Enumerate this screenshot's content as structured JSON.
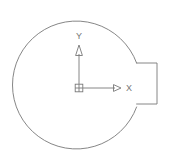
{
  "canvas": {
    "width": 171,
    "height": 165,
    "background_color": "#ffffff",
    "line_color": "#787878",
    "label_color": "#767676",
    "line_width": 0.9
  },
  "drawing": {
    "title": "",
    "type": "cad-2d-profile",
    "description": "Circular profile with rectangular keyway tab on the right side and a UCS coordinate axis icon at the center",
    "shape": {
      "name": "circle-with-rectangular-tab",
      "circle": {
        "center_x": 85,
        "center_y": 85,
        "radius": 64
      },
      "tab": {
        "name": "rectangular-tab",
        "left_x": 136,
        "right_x": 157,
        "top_y": 63,
        "bottom_y": 104
      }
    }
  },
  "ucs_icon": {
    "name": "ucs-coordinate-icon",
    "origin_x": 79,
    "origin_y": 88,
    "origin_marker": {
      "name": "origin-square-marker",
      "size": 8,
      "has_cross": true
    },
    "x_axis": {
      "label": "X",
      "label_x": 129,
      "label_y": 91,
      "line_end_x": 115,
      "arrow_tip_x": 121
    },
    "y_axis": {
      "label": "Y",
      "label_x": 79,
      "label_y": 39,
      "line_end_y": 54,
      "arrow_tip_y": 45
    }
  }
}
